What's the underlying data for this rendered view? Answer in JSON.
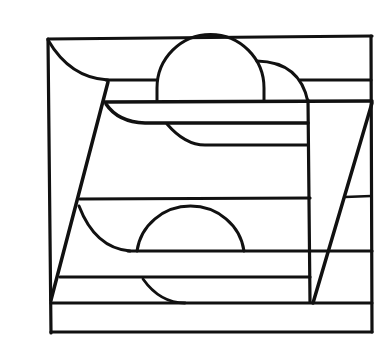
{
  "figure": {
    "title": "",
    "stroke_color": "#111111",
    "background": "#ffffff"
  }
}
